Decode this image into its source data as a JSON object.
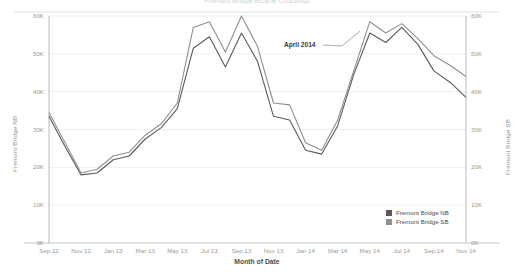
{
  "chart_data": {
    "type": "line",
    "title": "Fremont Bridge Bicycle Crossings",
    "xlabel": "Month of Date",
    "grid": true,
    "legend_position": "bottom-right",
    "axes": {
      "left": {
        "label": "Fremont Bridge NB",
        "ticks": [
          "0K",
          "10K",
          "20K",
          "30K",
          "40K",
          "50K",
          "60K"
        ],
        "min": 0,
        "max": 60000
      },
      "right": {
        "label": "Fremont Bridge SB",
        "ticks": [
          "0K",
          "10K",
          "20K",
          "30K",
          "40K",
          "50K",
          "60K"
        ],
        "min": 0,
        "max": 60000
      }
    },
    "categories": [
      "Sep 12",
      "Oct 12",
      "Nov 12",
      "Dec 12",
      "Jan 13",
      "Feb 13",
      "Mar 13",
      "Apr 13",
      "May 13",
      "Jun 13",
      "Jul 13",
      "Aug 13",
      "Sep 13",
      "Oct 13",
      "Nov 13",
      "Dec 13",
      "Jan 14",
      "Feb 14",
      "Mar 14",
      "Apr 14",
      "May 14",
      "Jun 14",
      "Jul 14",
      "Aug 14",
      "Sep 14",
      "Oct 14",
      "Nov 14"
    ],
    "x_tick_labels": [
      "Sep 12",
      "Nov 12",
      "Jan 13",
      "Mar 13",
      "May 13",
      "Jul 13",
      "Sep 13",
      "Nov 13",
      "Jan 14",
      "Mar 14",
      "May 14",
      "Jul 14",
      "Sep 14",
      "Nov 14"
    ],
    "series": [
      {
        "name": "Fremont Bridge NB",
        "color": "#5a5a5a",
        "values": [
          33500,
          25500,
          18000,
          18500,
          22000,
          23000,
          27500,
          30500,
          35500,
          51500,
          54500,
          46500,
          55500,
          48000,
          33500,
          32500,
          24500,
          23500,
          31000,
          44500,
          55500,
          53000,
          57000,
          52500,
          45500,
          42500,
          38500
        ]
      },
      {
        "name": "Fremont Bridge SB",
        "color": "#8f8f8f",
        "values": [
          34500,
          26500,
          18500,
          19500,
          23000,
          24000,
          28500,
          31500,
          37000,
          57000,
          58500,
          50500,
          60000,
          52000,
          37000,
          36500,
          26500,
          24500,
          32500,
          45500,
          58500,
          55500,
          58000,
          54000,
          49500,
          47000,
          44000
        ]
      }
    ],
    "annotations": [
      {
        "text": "April 2014",
        "x_category": "Apr 14"
      }
    ]
  }
}
